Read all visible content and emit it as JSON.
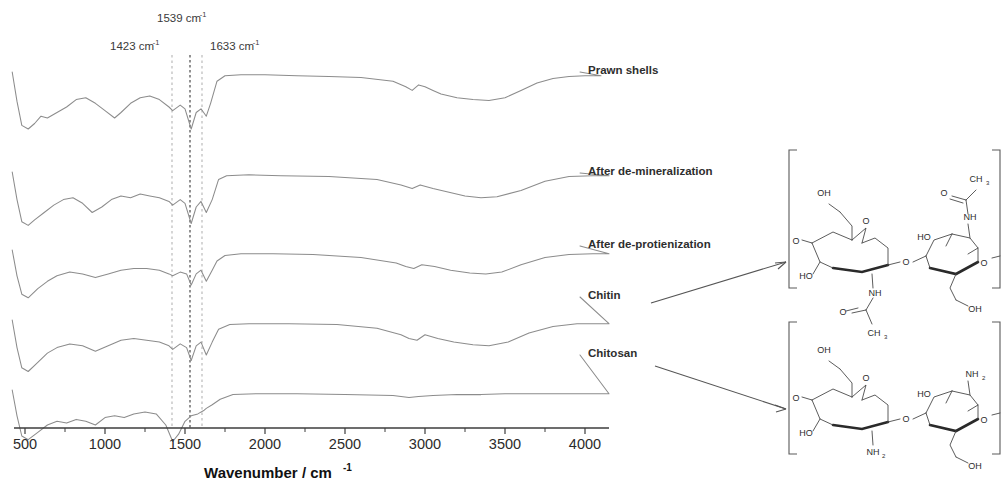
{
  "figure": {
    "type": "ftir-spectra",
    "axis_title": "Wavenumber / cm",
    "axis_title_sup": "-1"
  },
  "peak_markers": [
    {
      "label": "1423 cm",
      "sup": "-1",
      "wavenumber": 1423,
      "x": 172,
      "text_x": 110,
      "text_y": 50,
      "style": "light"
    },
    {
      "label": "1539 cm",
      "sup": "-1",
      "wavenumber": 1539,
      "x": 190,
      "text_x": 157,
      "text_y": 22,
      "style": "dark"
    },
    {
      "label": "1633 cm",
      "sup": "-1",
      "wavenumber": 1633,
      "x": 202,
      "text_x": 210,
      "text_y": 50,
      "style": "light"
    }
  ],
  "xaxis": {
    "ticks": [
      500,
      1000,
      1500,
      2000,
      2500,
      3000,
      3500,
      4000
    ],
    "tick_labels": [
      "500",
      "1000",
      "1500",
      "2000",
      "2500",
      "3000",
      "3500",
      "4000"
    ],
    "min": 400,
    "max": 4200
  },
  "traces": [
    {
      "name": "Prawn shells",
      "label": "Prawn shells",
      "label_x": 588,
      "label_y": 74,
      "baseline": 72
    },
    {
      "name": "After de-mineralization",
      "label": "After de-mineralization",
      "label_x": 588,
      "label_y": 175,
      "baseline": 172
    },
    {
      "name": "After de-protienization",
      "label": "After de-protienization",
      "label_x": 588,
      "label_y": 248,
      "baseline": 250
    },
    {
      "name": "Chitin",
      "label": "Chitin",
      "label_x": 588,
      "label_y": 299,
      "baseline": 320
    },
    {
      "name": "Chitosan",
      "label": "Chitosan",
      "label_x": 588,
      "label_y": 357,
      "baseline": 390
    }
  ],
  "structures": [
    {
      "name": "chitin",
      "atoms": [
        "CH",
        "3",
        "O",
        "NH",
        "OH",
        "HO",
        "O",
        "O",
        "NH",
        "O",
        "CH",
        "3",
        "OH",
        "HO"
      ]
    },
    {
      "name": "chitosan",
      "atoms": [
        "OH",
        "O",
        "HO",
        "O",
        "NH",
        "2",
        "NH",
        "2",
        "OH",
        "HO",
        "O"
      ]
    }
  ],
  "chart_data": {
    "type": "line",
    "title": "",
    "xlabel": "Wavenumber / cm-1",
    "ylabel": "",
    "xlim": [
      400,
      4200
    ],
    "grid": false,
    "legend": "inline-right-labels",
    "annotations": [
      {
        "text": "1423 cm-1",
        "x": 1423
      },
      {
        "text": "1539 cm-1",
        "x": 1539
      },
      {
        "text": "1633 cm-1",
        "x": 1633
      }
    ],
    "series": [
      {
        "name": "Prawn shells",
        "x": [
          420,
          450,
          480,
          520,
          560,
          600,
          640,
          700,
          760,
          820,
          880,
          940,
          1000,
          1060,
          1100,
          1160,
          1220,
          1280,
          1340,
          1400,
          1423,
          1470,
          1500,
          1539,
          1570,
          1600,
          1633,
          1660,
          1700,
          1750,
          1850,
          2000,
          2200,
          2400,
          2600,
          2800,
          2880,
          2920,
          2960,
          3000,
          3050,
          3100,
          3200,
          3300,
          3400,
          3500,
          3600,
          3700,
          3800,
          3900,
          4000,
          4100
        ],
        "y": [
          100,
          68,
          42,
          38,
          44,
          52,
          50,
          56,
          62,
          70,
          72,
          66,
          58,
          50,
          56,
          66,
          72,
          74,
          70,
          62,
          58,
          64,
          60,
          38,
          56,
          60,
          52,
          66,
          90,
          96,
          97,
          97,
          96,
          95,
          94,
          90,
          84,
          80,
          86,
          84,
          80,
          76,
          72,
          70,
          69,
          72,
          80,
          88,
          93,
          95,
          96,
          96
        ]
      },
      {
        "name": "After de-mineralization",
        "x": [
          420,
          450,
          480,
          520,
          560,
          620,
          680,
          740,
          800,
          860,
          920,
          980,
          1040,
          1100,
          1160,
          1220,
          1280,
          1340,
          1400,
          1423,
          1470,
          1500,
          1539,
          1570,
          1600,
          1633,
          1670,
          1710,
          1760,
          1900,
          2100,
          2400,
          2700,
          2850,
          2920,
          2970,
          3050,
          3150,
          3250,
          3350,
          3450,
          3600,
          3750,
          3900,
          4050,
          4150
        ],
        "y": [
          100,
          70,
          46,
          42,
          48,
          56,
          64,
          70,
          72,
          66,
          56,
          62,
          70,
          74,
          72,
          76,
          74,
          72,
          68,
          64,
          70,
          66,
          44,
          62,
          68,
          56,
          70,
          92,
          96,
          97,
          96,
          95,
          92,
          86,
          82,
          86,
          82,
          78,
          74,
          72,
          73,
          80,
          90,
          95,
          96,
          96
        ]
      },
      {
        "name": "After de-protienization",
        "x": [
          420,
          450,
          480,
          520,
          580,
          640,
          700,
          780,
          860,
          940,
          1020,
          1100,
          1180,
          1260,
          1340,
          1400,
          1423,
          1470,
          1510,
          1539,
          1570,
          1600,
          1633,
          1670,
          1700,
          1750,
          1850,
          2050,
          2300,
          2600,
          2820,
          2880,
          2930,
          2980,
          3060,
          3160,
          3280,
          3380,
          3480,
          3600,
          3750,
          3900,
          4050,
          4150
        ],
        "y": [
          100,
          72,
          52,
          48,
          58,
          66,
          72,
          76,
          74,
          70,
          74,
          78,
          80,
          80,
          78,
          74,
          72,
          76,
          74,
          62,
          74,
          78,
          66,
          78,
          88,
          94,
          96,
          96,
          95,
          92,
          86,
          82,
          80,
          84,
          82,
          78,
          75,
          74,
          76,
          84,
          92,
          95,
          96,
          96
        ]
      },
      {
        "name": "Chitin",
        "x": [
          420,
          450,
          480,
          520,
          580,
          640,
          700,
          780,
          860,
          940,
          1020,
          1100,
          1180,
          1260,
          1340,
          1400,
          1423,
          1470,
          1510,
          1539,
          1570,
          1600,
          1633,
          1670,
          1710,
          1780,
          1900,
          2150,
          2450,
          2700,
          2850,
          2900,
          2950,
          3000,
          3080,
          3180,
          3300,
          3400,
          3520,
          3650,
          3800,
          3950,
          4100,
          4150
        ],
        "y": [
          100,
          70,
          48,
          44,
          54,
          64,
          70,
          74,
          72,
          66,
          72,
          78,
          80,
          78,
          76,
          72,
          68,
          74,
          70,
          56,
          72,
          76,
          62,
          76,
          90,
          95,
          96,
          96,
          95,
          91,
          84,
          80,
          78,
          84,
          80,
          76,
          73,
          72,
          76,
          86,
          93,
          96,
          96,
          96
        ]
      },
      {
        "name": "Chitosan",
        "x": [
          420,
          450,
          480,
          520,
          580,
          640,
          700,
          760,
          820,
          880,
          940,
          1000,
          1060,
          1120,
          1180,
          1250,
          1320,
          1380,
          1423,
          1460,
          1500,
          1539,
          1580,
          1620,
          1633,
          1670,
          1720,
          1800,
          1950,
          2200,
          2500,
          2800,
          2900,
          2960,
          3050,
          3200,
          3350,
          3500,
          3700,
          3900,
          4050,
          4150
        ],
        "y": [
          100,
          72,
          50,
          46,
          54,
          62,
          66,
          64,
          68,
          66,
          62,
          70,
          72,
          70,
          74,
          76,
          74,
          62,
          44,
          52,
          66,
          72,
          74,
          78,
          80,
          84,
          90,
          95,
          96,
          96,
          95,
          94,
          92,
          93,
          94,
          95,
          95,
          96,
          96,
          96,
          96,
          96
        ]
      }
    ]
  }
}
